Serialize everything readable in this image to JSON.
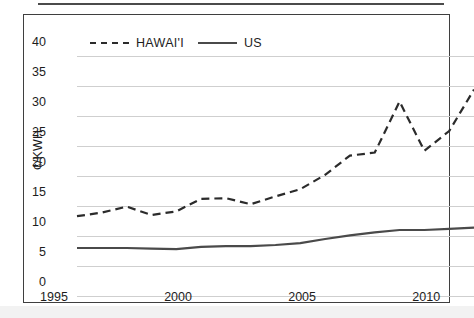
{
  "chart_data": {
    "type": "line",
    "title": "",
    "xlabel": "",
    "ylabel": "¢/KWH",
    "xlim": [
      1995,
      2011
    ],
    "ylim": [
      0,
      40
    ],
    "grid": true,
    "legend_position": "top-left",
    "x": [
      1995,
      1996,
      1997,
      1998,
      1999,
      2000,
      2001,
      2002,
      2003,
      2004,
      2005,
      2006,
      2007,
      2008,
      2009,
      2010,
      2011
    ],
    "xticks": [
      "1995",
      "2000",
      "2005",
      "2010"
    ],
    "xtick_values": [
      1995,
      2000,
      2005,
      2010
    ],
    "yticks": [
      "0",
      "5",
      "10",
      "15",
      "20",
      "25",
      "30",
      "35",
      "40"
    ],
    "ytick_values": [
      0,
      5,
      10,
      15,
      20,
      25,
      30,
      35,
      40
    ],
    "series": [
      {
        "name": "HAWAI'I",
        "style": "dashed",
        "color": "#2b2b2b",
        "values": [
          13.3,
          13.9,
          14.9,
          13.5,
          14.1,
          16.2,
          16.3,
          15.3,
          16.6,
          17.8,
          20.2,
          23.4,
          23.9,
          32.4,
          24.2,
          27.5,
          34.4
        ]
      },
      {
        "name": "US",
        "style": "solid",
        "color": "#4a4a4a",
        "values": [
          8.0,
          8.0,
          8.0,
          7.9,
          7.8,
          8.2,
          8.3,
          8.3,
          8.5,
          8.8,
          9.5,
          10.1,
          10.6,
          11.0,
          11.0,
          11.2,
          11.4
        ]
      }
    ]
  },
  "legend": {
    "items": [
      {
        "label": "HAWAI'I",
        "marker": "dashed-line-icon"
      },
      {
        "label": "US",
        "marker": "solid-line-icon"
      }
    ]
  },
  "axes": {
    "y_title": "¢/KWH",
    "y_labels": [
      "40",
      "35",
      "30",
      "25",
      "20",
      "15",
      "10",
      "5",
      "0"
    ],
    "x_labels": [
      "1995",
      "2000",
      "2005",
      "2010"
    ]
  }
}
